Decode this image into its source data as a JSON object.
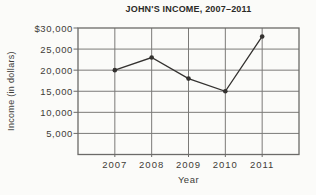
{
  "page": {
    "background": "#fbfbf9"
  },
  "chart_data": {
    "type": "line",
    "title": "JOHN'S INCOME, 2007–2011",
    "xlabel": "Year",
    "ylabel": "Income (in dollars)",
    "categories": [
      "2007",
      "2008",
      "2009",
      "2010",
      "2011"
    ],
    "values": [
      20000,
      23000,
      18000,
      15000,
      28000
    ],
    "series_name": "John's income",
    "ylim": [
      0,
      30000
    ],
    "ytick_interval": 5000,
    "ytick_labels_bottom_to_top": [
      "5,000",
      "10,000",
      "15,000",
      "20,000",
      "25,000",
      "$30,000"
    ],
    "grid": "full",
    "legend_position": "none",
    "marker": "dot",
    "colors": {
      "line": "#343230",
      "marker": "#343230",
      "grid": "#7b7a78",
      "frame": "#6b6a68",
      "title_text": "#2b2a27",
      "axis_text": "#3f3c37"
    }
  }
}
